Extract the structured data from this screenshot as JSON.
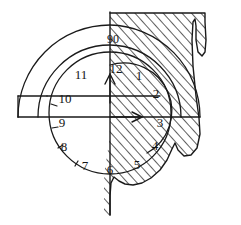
{
  "figure": {
    "background_color": "#ffffff",
    "ink_color": "#1a1a1a",
    "hatch_color": "#2a2a2a",
    "width": 241,
    "height": 225
  },
  "angle_label": {
    "name": "angle-label-90",
    "text": "90"
  },
  "clock": {
    "center_x": 110,
    "center_y": 113,
    "radius": 63,
    "numerals": [
      {
        "label": "12",
        "hour": 12,
        "x": 116,
        "y": 70
      },
      {
        "label": "1",
        "hour": 1,
        "x": 139,
        "y": 77
      },
      {
        "label": "2",
        "hour": 2,
        "x": 156,
        "y": 95
      },
      {
        "label": "3",
        "hour": 3,
        "x": 160,
        "y": 124
      },
      {
        "label": "4",
        "hour": 4,
        "x": 155,
        "y": 147
      },
      {
        "label": "5",
        "hour": 5,
        "x": 137,
        "y": 166
      },
      {
        "label": "6",
        "hour": 6,
        "x": 110,
        "y": 171
      },
      {
        "label": "7",
        "hour": 7,
        "x": 85,
        "y": 167
      },
      {
        "label": "8",
        "hour": 8,
        "x": 64,
        "y": 148
      },
      {
        "label": "9",
        "hour": 9,
        "x": 62,
        "y": 124
      },
      {
        "label": "10",
        "hour": 10,
        "x": 65,
        "y": 100
      },
      {
        "label": "11",
        "hour": 11,
        "x": 81,
        "y": 76
      }
    ]
  },
  "arrows": [
    {
      "name": "arrow-up-twelve",
      "direction": "up",
      "from_x": 110,
      "from_y": 103,
      "to_x": 110,
      "to_y": 74
    },
    {
      "name": "arrow-right-three",
      "direction": "right",
      "from_x": 110,
      "from_y": 117,
      "to_x": 142,
      "to_y": 117
    }
  ],
  "arcs": [
    {
      "name": "outer-arc",
      "radius": 100,
      "description": "outermost semicircular arc"
    },
    {
      "name": "middle-arc",
      "radius": 83,
      "description": "middle semicircular arc"
    },
    {
      "name": "clock-circle",
      "radius": 63,
      "description": "clock dial circle"
    },
    {
      "name": "inner-right-arc",
      "radius": 48,
      "description": "inner arc on right half"
    }
  ],
  "lines": [
    {
      "name": "horizontal-baseline",
      "y": 117,
      "x1": 18,
      "x2": 200
    },
    {
      "name": "horizontal-upper-line",
      "y": 96,
      "x1": 47,
      "x2": 160
    },
    {
      "name": "vertical-axis",
      "x": 110,
      "y1": 12,
      "y2": 215
    },
    {
      "name": "left-box-edge",
      "x": 18,
      "y1": 96,
      "y2": 117
    }
  ],
  "hatched_region": {
    "name": "hatched-quadrant",
    "description": "diagonal line hatching filling right region with scalloped bottom-right edge and notch on right border",
    "fill_pattern": "diagonal-hatch",
    "left_boundary_x": 110,
    "top_y": 12,
    "right_x": 205
  }
}
